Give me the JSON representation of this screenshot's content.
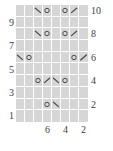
{
  "chart_data": {
    "type": "table",
    "title": "",
    "subtitle": "",
    "xlabel": "",
    "ylabel": "",
    "grid": true,
    "legend_position": "none",
    "columns": 8,
    "rows": 10,
    "row_labels_left": [
      "9",
      "7",
      "5",
      "3",
      "1"
    ],
    "row_labels_right": [
      "10",
      "8",
      "6",
      "4",
      "2"
    ],
    "column_labels_bottom": [
      "6",
      "4",
      "2"
    ],
    "column_label_positions": [
      3,
      5,
      7
    ],
    "row_label_left_rows": [
      2,
      4,
      6,
      8,
      10
    ],
    "row_label_right_rows": [
      1,
      3,
      5,
      7,
      9
    ],
    "symbols_legend": {
      "O": "yarn-over",
      "/": "right-slanting-decrease",
      "\\": "left-slanting-decrease",
      "": "knit-blank"
    },
    "cells": [
      [
        "",
        "",
        "\\",
        "O",
        "",
        "O",
        "/",
        ""
      ],
      [
        "",
        "",
        "",
        "",
        "",
        "",
        "",
        ""
      ],
      [
        "",
        "",
        "\\",
        "O",
        "",
        "O",
        "/",
        ""
      ],
      [
        "",
        "",
        "",
        "",
        "",
        "",
        "",
        ""
      ],
      [
        "\\",
        "O",
        "",
        "",
        "",
        "",
        "O",
        "/"
      ],
      [
        "",
        "",
        "",
        "",
        "",
        "",
        "",
        ""
      ],
      [
        "",
        "",
        "O",
        "/",
        "\\",
        "O",
        "",
        ""
      ],
      [
        "",
        "",
        "",
        "",
        "",
        "",
        "",
        ""
      ],
      [
        "",
        "",
        "",
        "O",
        "\\",
        "",
        "",
        ""
      ],
      [
        "",
        "",
        "",
        "",
        "",
        "",
        "",
        ""
      ]
    ],
    "row_numbers_top_to_bottom": [
      10,
      9,
      8,
      7,
      6,
      5,
      4,
      3,
      2,
      1
    ]
  },
  "colors": {
    "grid_background": "#d6d6d6",
    "grid_line": "#ffffff",
    "symbol": "#4a4a4a",
    "label_text": "#3c3c3c",
    "page_background": "#ffffff"
  }
}
